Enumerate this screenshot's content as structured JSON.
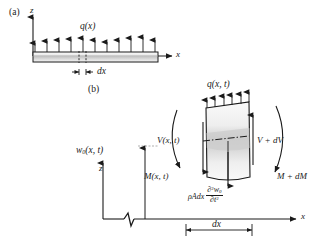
{
  "figure": {
    "panel_a": {
      "label": "(a)",
      "axis_z": "z",
      "axis_x": "x",
      "load_label": "q(x)",
      "dx_label": "dx",
      "num_load_arrows": 11
    },
    "panel_b": {
      "label": "(b)",
      "axis_z": "z",
      "axis_x": "x",
      "load_label": "q(x, t)",
      "num_load_arrows": 6,
      "deflection_label": "w",
      "deflection_sub": "0",
      "deflection_args": "(x, t)",
      "shear_left": "V(x, t)",
      "shear_right": "V + dV",
      "moment_left": "M(x, t)",
      "moment_right": "M + dM",
      "inertia_prefix": "ρAdx",
      "inertia_num_d": "∂",
      "inertia_num_sup": "2",
      "inertia_num_w": "w",
      "inertia_num_sub": "0",
      "inertia_den_d": "∂",
      "inertia_den_t": "t",
      "inertia_den_sup": "2",
      "dx_label": "dx"
    }
  },
  "colors": {
    "line": "#1a1a1a",
    "beam_fill_light": "#f2f2f2",
    "beam_fill_mid": "#d2d2d2",
    "element_fill": "#ededed",
    "element_band": "#cfcfcf"
  }
}
